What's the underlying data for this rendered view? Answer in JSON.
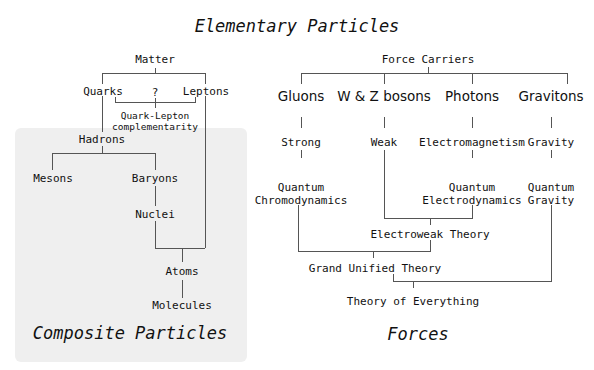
{
  "titles": {
    "elementary": "Elementary Particles",
    "composite": "Composite Particles",
    "forces": "Forces"
  },
  "matter": {
    "root": "Matter",
    "quarks": "Quarks",
    "question": "?",
    "leptons": "Leptons",
    "complementarity_line1": "Quark-Lepton",
    "complementarity_line2": "complementarity",
    "hadrons": "Hadrons",
    "mesons": "Mesons",
    "baryons": "Baryons",
    "nuclei": "Nuclei",
    "atoms": "Atoms",
    "molecules": "Molecules"
  },
  "forces": {
    "root": "Force Carriers",
    "carriers": [
      "Gluons",
      "W & Z bosons",
      "Photons",
      "Gravitons"
    ],
    "interactions": [
      "Strong",
      "Weak",
      "Electromagnetism",
      "Gravity"
    ],
    "qcd_line1": "Quantum",
    "qcd_line2": "Chromodynamics",
    "qed_line1": "Quantum",
    "qed_line2": "Electrodynamics",
    "qg_line1": "Quantum",
    "qg_line2": "Gravity",
    "electroweak": "Electroweak Theory",
    "gut": "Grand Unified Theory",
    "toe": "Theory of Everything"
  }
}
